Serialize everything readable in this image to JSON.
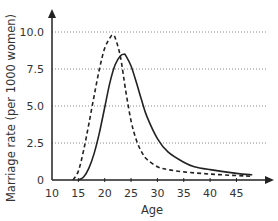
{
  "chart_data": {
    "type": "line",
    "title": "",
    "xlabel": "Age",
    "ylabel": "Marriage rate (per 1000 women)",
    "xlim": [
      10,
      50
    ],
    "ylim": [
      0,
      11
    ],
    "x_ticks": [
      "10",
      "15",
      "20",
      "25",
      "30",
      "35",
      "40",
      "45"
    ],
    "y_ticks": [
      "0",
      "2.5",
      "5.0",
      "7.5",
      "10.0"
    ],
    "grid": {
      "horizontal": true,
      "style": "dotted"
    },
    "legend": null,
    "series": [
      {
        "name": "dashed curve",
        "style": "dashed",
        "x": [
          14,
          15,
          16,
          17,
          18,
          19,
          20,
          21,
          21.5,
          22,
          23,
          24,
          25,
          26,
          27,
          28,
          30,
          32,
          35,
          40,
          45,
          48
        ],
        "values": [
          0,
          0.6,
          2.0,
          3.8,
          5.7,
          7.5,
          8.9,
          9.6,
          9.8,
          9.6,
          8.3,
          6.0,
          4.0,
          2.7,
          1.9,
          1.4,
          0.9,
          0.7,
          0.55,
          0.4,
          0.3,
          0.25
        ]
      },
      {
        "name": "solid curve",
        "style": "solid",
        "x": [
          15,
          16,
          17,
          18,
          19,
          20,
          21,
          22,
          23,
          23.7,
          24,
          25,
          26,
          27,
          28,
          30,
          32,
          35,
          37,
          40,
          45,
          48
        ],
        "values": [
          0,
          0.2,
          0.8,
          1.8,
          3.2,
          4.9,
          6.6,
          7.8,
          8.4,
          8.5,
          8.4,
          7.7,
          6.6,
          5.4,
          4.3,
          2.8,
          1.9,
          1.2,
          0.9,
          0.7,
          0.45,
          0.35
        ]
      }
    ]
  }
}
